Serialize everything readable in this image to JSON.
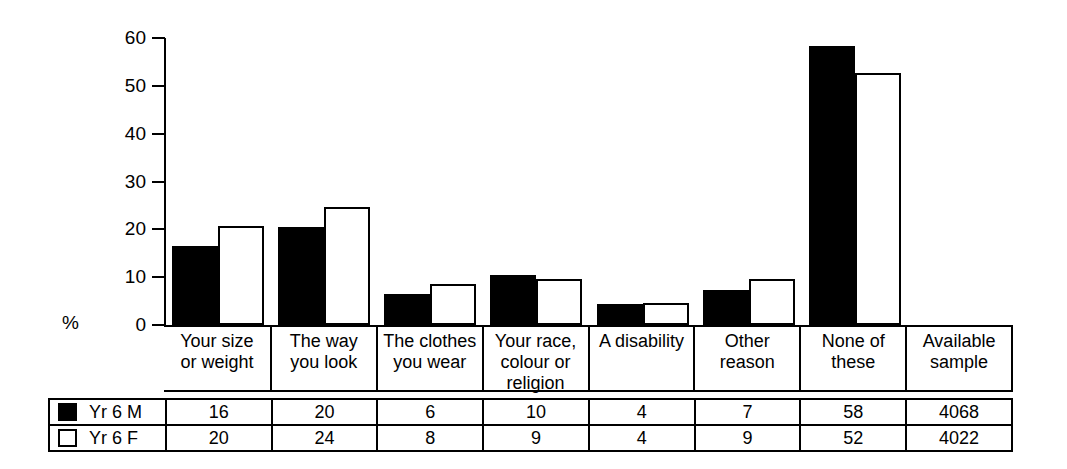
{
  "chart_data": {
    "type": "bar",
    "title": "",
    "subtitle": "",
    "xlabel": "",
    "ylabel": "%",
    "ylim": [
      0,
      60
    ],
    "yticks": [
      0,
      10,
      20,
      30,
      40,
      50,
      60
    ],
    "grid": false,
    "legend_position": "table-left",
    "categories": [
      "Your size or weight",
      "The way you look",
      "The clothes you wear",
      "Your race, colour or religion",
      "A disability",
      "Other reason",
      "None of these"
    ],
    "series": [
      {
        "name": "Yr 6 M",
        "color": "#000000",
        "fill": "solid",
        "values": [
          16,
          20,
          6,
          10,
          4,
          7,
          58
        ]
      },
      {
        "name": "Yr 6 F",
        "color": "#ffffff",
        "fill": "hollow",
        "values": [
          20,
          24,
          8,
          9,
          4,
          9,
          52
        ]
      }
    ],
    "available_sample": {
      "Yr 6 M": 4068,
      "Yr 6 F": 4022
    }
  },
  "axis": {
    "percent_label": "%",
    "ticks": [
      {
        "value": 60,
        "label": "60"
      },
      {
        "value": 50,
        "label": "50"
      },
      {
        "value": 40,
        "label": "40"
      },
      {
        "value": 30,
        "label": "30"
      },
      {
        "value": 20,
        "label": "20"
      },
      {
        "value": 10,
        "label": "10"
      },
      {
        "value": 0,
        "label": "0"
      }
    ]
  },
  "category_labels": [
    {
      "line1": "Your size",
      "line2": "or weight",
      "line3": ""
    },
    {
      "line1": "The way",
      "line2": "you look",
      "line3": ""
    },
    {
      "line1": "The clothes",
      "line2": "you wear",
      "line3": ""
    },
    {
      "line1": "Your race,",
      "line2": "colour or",
      "line3": "religion"
    },
    {
      "line1": "A disability",
      "line2": "",
      "line3": ""
    },
    {
      "line1": "Other reason",
      "line2": "",
      "line3": ""
    },
    {
      "line1": "None of these",
      "line2": "",
      "line3": ""
    },
    {
      "line1": "Available",
      "line2": "sample",
      "line3": ""
    }
  ],
  "table": {
    "rows": [
      {
        "legend_label": "Yr 6 M",
        "swatch": "filled-square",
        "cells": [
          "16",
          "20",
          "6",
          "10",
          "4",
          "7",
          "58",
          "4068"
        ]
      },
      {
        "legend_label": "Yr 6 F",
        "swatch": "hollow-square",
        "cells": [
          "20",
          "24",
          "8",
          "9",
          "4",
          "9",
          "52",
          "4022"
        ]
      }
    ]
  }
}
